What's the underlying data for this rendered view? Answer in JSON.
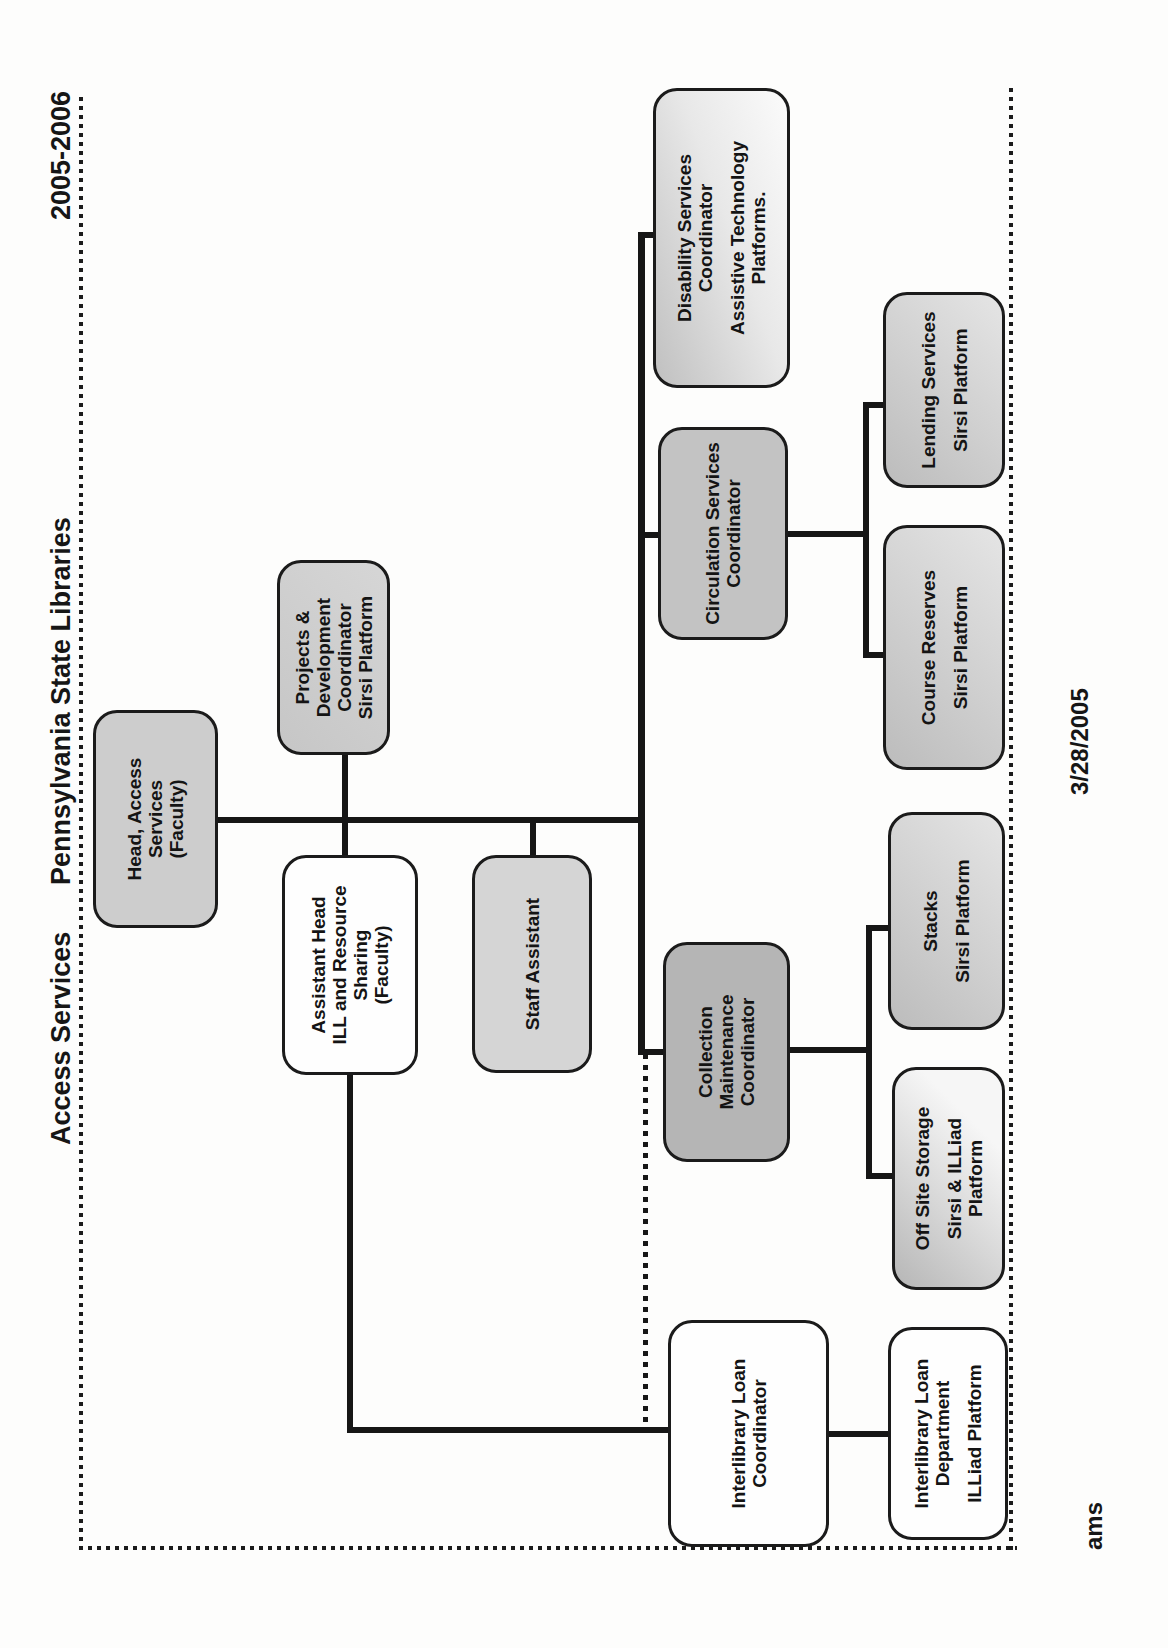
{
  "page": {
    "headers": {
      "left": "Access Services",
      "center": "Pennsylvania State Libraries",
      "right": "2005-2006"
    },
    "footer": {
      "date": "3/28/2005",
      "initials": "ams"
    }
  },
  "boxes": [
    {
      "id": "head-access-services",
      "lines": [
        "Head, Access",
        "Services",
        "(Faculty)"
      ]
    },
    {
      "id": "assistant-head",
      "lines": [
        "Assistant Head",
        "ILL and Resource",
        "Sharing",
        "(Faculty)"
      ]
    },
    {
      "id": "projects-development-coordinator",
      "lines": [
        "Projects &",
        "Development",
        "Coordinator",
        "Sirsi Platform"
      ]
    },
    {
      "id": "staff-assistant",
      "lines": [
        "Staff Assistant"
      ]
    },
    {
      "id": "disability-services-coordinator",
      "lines": [
        "Disability Services",
        "Coordinator",
        "",
        "Assistive Technology",
        "Platforms."
      ]
    },
    {
      "id": "circulation-services-coordinator",
      "lines": [
        "Circulation Services",
        "Coordinator"
      ]
    },
    {
      "id": "collection-maintenance-coordinator",
      "lines": [
        "Collection",
        "Maintenance",
        "Coordinator"
      ]
    },
    {
      "id": "interlibrary-loan-coordinator",
      "lines": [
        "Interlibrary Loan",
        "Coordinator"
      ]
    },
    {
      "id": "lending-services",
      "lines": [
        "Lending Services",
        "",
        "Sirsi Platform"
      ]
    },
    {
      "id": "course-reserves",
      "lines": [
        "Course Reserves",
        "",
        "Sirsi Platform"
      ]
    },
    {
      "id": "stacks",
      "lines": [
        "Stacks",
        "",
        "Sirsi Platform"
      ]
    },
    {
      "id": "off-site-storage",
      "lines": [
        "Off Site Storage",
        "",
        "Sirsi & ILLiad",
        "Platform"
      ]
    },
    {
      "id": "interlibrary-loan-department",
      "lines": [
        "Interlibrary Loan",
        "Department",
        "",
        "ILLiad Platform"
      ]
    }
  ]
}
